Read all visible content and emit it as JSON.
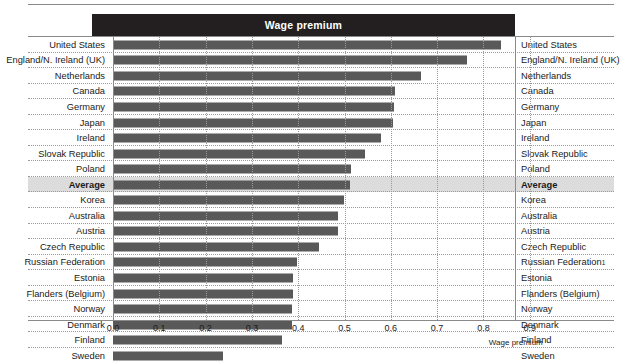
{
  "header": {
    "title": "Wage premium"
  },
  "axis": {
    "title": "Wage premium",
    "ticks": [
      "0.0",
      "0.1",
      "0.2",
      "0.3",
      "0.4",
      "0.5",
      "0.6",
      "0.7",
      "0.8",
      "0.9"
    ]
  },
  "colors": {
    "header_bar": "#231f20",
    "bar": "#595959",
    "highlight_row": "#dcdcdc",
    "gridline": "#9a9a9a",
    "axis": "#8a8a8a"
  },
  "rows": [
    {
      "label": "United States",
      "label_right": "United States",
      "value": 0.838,
      "highlight": false
    },
    {
      "label": "England/N. Ireland (UK)",
      "label_right": "England/N. Ireland (UK)",
      "value": 0.765,
      "highlight": false
    },
    {
      "label": "Netherlands",
      "label_right": "Netherlands",
      "value": 0.666,
      "highlight": false
    },
    {
      "label": "Canada",
      "label_right": "Canada",
      "value": 0.609,
      "highlight": false
    },
    {
      "label": "Germany",
      "label_right": "Germany",
      "value": 0.607,
      "highlight": false
    },
    {
      "label": "Japan",
      "label_right": "Japan",
      "value": 0.604,
      "highlight": false
    },
    {
      "label": "Ireland",
      "label_right": "Ireland",
      "value": 0.578,
      "highlight": false
    },
    {
      "label": "Slovak Republic",
      "label_right": "Slovak Republic",
      "value": 0.544,
      "highlight": false
    },
    {
      "label": "Poland",
      "label_right": "Poland",
      "value": 0.514,
      "highlight": false
    },
    {
      "label": "Average",
      "label_right": "Average",
      "value": 0.512,
      "highlight": true
    },
    {
      "label": "Korea",
      "label_right": "Korea",
      "value": 0.498,
      "highlight": false
    },
    {
      "label": "Australia",
      "label_right": "Australia",
      "value": 0.487,
      "highlight": false
    },
    {
      "label": "Austria",
      "label_right": "Austria",
      "value": 0.487,
      "highlight": false
    },
    {
      "label": "Czech Republic",
      "label_right": "Czech Republic",
      "value": 0.445,
      "highlight": false
    },
    {
      "label": "Russian Federation",
      "label_right": "Russian Federation",
      "value": 0.397,
      "highlight": false,
      "footnote": "1"
    },
    {
      "label": "Estonia",
      "label_right": "Estonia",
      "value": 0.389,
      "highlight": false
    },
    {
      "label": "Flanders (Belgium)",
      "label_right": "Flanders (Belgium)",
      "value": 0.388,
      "highlight": false
    },
    {
      "label": "Norway",
      "label_right": "Norway",
      "value": 0.387,
      "highlight": false
    },
    {
      "label": "Denmark",
      "label_right": "Denmark",
      "value": 0.386,
      "highlight": false
    },
    {
      "label": "Finland",
      "label_right": "Finland",
      "value": 0.364,
      "highlight": false
    },
    {
      "label": "Sweden",
      "label_right": "Sweden",
      "value": 0.238,
      "highlight": false
    }
  ],
  "chart_data": {
    "type": "bar",
    "orientation": "horizontal",
    "title": "Wage premium",
    "xlabel": "Wage premium",
    "ylabel": "",
    "xlim": [
      0.0,
      0.9
    ],
    "xticks": [
      0.0,
      0.1,
      0.2,
      0.3,
      0.4,
      0.5,
      0.6,
      0.7,
      0.8,
      0.9
    ],
    "grid": "vertical-dotted",
    "legend": "none",
    "categories": [
      "United States",
      "England/N. Ireland (UK)",
      "Netherlands",
      "Canada",
      "Germany",
      "Japan",
      "Ireland",
      "Slovak Republic",
      "Poland",
      "Average",
      "Korea",
      "Australia",
      "Austria",
      "Czech Republic",
      "Russian Federation",
      "Estonia",
      "Flanders (Belgium)",
      "Norway",
      "Denmark",
      "Finland",
      "Sweden"
    ],
    "values": [
      0.838,
      0.765,
      0.666,
      0.609,
      0.607,
      0.604,
      0.578,
      0.544,
      0.514,
      0.512,
      0.498,
      0.487,
      0.487,
      0.445,
      0.397,
      0.389,
      0.388,
      0.387,
      0.386,
      0.364,
      0.238
    ],
    "highlighted_category": "Average",
    "annotations": [
      "Russian Federation has footnote marker 1"
    ]
  }
}
